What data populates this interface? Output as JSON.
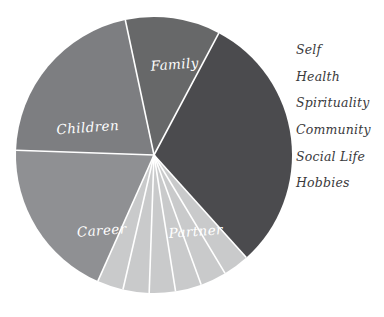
{
  "chart_data": {
    "type": "pie",
    "title": "",
    "categories": [
      "Family",
      "Self",
      "Health",
      "Spirituality",
      "Community",
      "Social Life",
      "Hobbies",
      "Partner",
      "Career",
      "Children"
    ],
    "values": [
      18,
      3,
      3,
      3,
      3,
      3,
      3,
      16,
      17,
      19
    ],
    "labels_inside": [
      "Family",
      "Partner",
      "Career",
      "Children"
    ],
    "legend_entries": [
      "Self",
      "Health",
      "Spirituality",
      "Community",
      "Social Life",
      "Hobbies"
    ],
    "legend_position": "right",
    "grid": false,
    "xlabel": "",
    "ylabel": "",
    "colors": {
      "family": "#4b4b4e",
      "thin_slices": "#c9cacb",
      "partner": "#8f9093",
      "career": "#7d7e81",
      "children": "#676869",
      "divider": "#ffffff",
      "background": "#ffffff",
      "legend_text": "#3a3a3c",
      "slice_label_text": "#ffffff"
    },
    "slices": [
      {
        "name": "Family",
        "start_deg": -62,
        "end_deg": 48,
        "color": "#4b4b4e",
        "label": "Family",
        "label_x": 175,
        "label_y": 69,
        "label_inside": true
      },
      {
        "name": "Self",
        "start_deg": 48,
        "end_deg": 59,
        "color": "#c9cacb",
        "label": "Self",
        "label_inside": false
      },
      {
        "name": "Health",
        "start_deg": 59,
        "end_deg": 70,
        "color": "#c9cacb",
        "label": "Health",
        "label_inside": false
      },
      {
        "name": "Spirituality",
        "start_deg": 70,
        "end_deg": 81,
        "color": "#c9cacb",
        "label": "Spirituality",
        "label_inside": false
      },
      {
        "name": "Community",
        "start_deg": 81,
        "end_deg": 92,
        "color": "#c9cacb",
        "label": "Community",
        "label_inside": false
      },
      {
        "name": "Social Life",
        "start_deg": 92,
        "end_deg": 103,
        "color": "#c9cacb",
        "label": "Social Life",
        "label_inside": false
      },
      {
        "name": "Hobbies",
        "start_deg": 103,
        "end_deg": 114,
        "color": "#c9cacb",
        "label": "Hobbies",
        "label_inside": false
      },
      {
        "name": "Partner",
        "start_deg": 114,
        "end_deg": 182,
        "color": "#8f9093",
        "label": "Partner",
        "label_x": 196,
        "label_y": 236,
        "label_inside": true
      },
      {
        "name": "Career",
        "start_deg": 182,
        "end_deg": 258,
        "color": "#7d7e81",
        "label": "Career",
        "label_x": 102,
        "label_y": 235,
        "label_inside": true
      },
      {
        "name": "Children",
        "start_deg": 258,
        "end_deg": 298,
        "color": "#676869",
        "label": "Children",
        "label_x": 88,
        "label_y": 132,
        "label_inside": true
      }
    ],
    "geometry": {
      "cx": 154,
      "cy": 155,
      "r": 138
    }
  }
}
